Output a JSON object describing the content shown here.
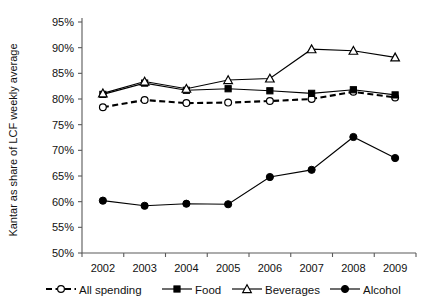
{
  "chart_data": {
    "type": "line",
    "title": "",
    "xlabel": "",
    "ylabel": "Kantar as share of LCF weekly average",
    "categories": [
      "2002",
      "2003",
      "2004",
      "2005",
      "2006",
      "2007",
      "2008",
      "2009"
    ],
    "x": [
      2002,
      2003,
      2004,
      2005,
      2006,
      2007,
      2008,
      2009
    ],
    "ylim": [
      50,
      95
    ],
    "yticks": [
      50,
      55,
      60,
      65,
      70,
      75,
      80,
      85,
      90,
      95
    ],
    "ytick_labels": [
      "50%",
      "55%",
      "60%",
      "65%",
      "70%",
      "75%",
      "80%",
      "85%",
      "90%",
      "95%"
    ],
    "grid": false,
    "legend_position": "bottom",
    "series": [
      {
        "name": "All spending",
        "values": [
          78.4,
          79.8,
          79.2,
          79.3,
          79.6,
          80.0,
          81.4,
          80.3
        ],
        "line_style": "dashed",
        "marker": "open-circle"
      },
      {
        "name": "Food",
        "values": [
          80.9,
          83.1,
          81.7,
          82.0,
          81.6,
          81.1,
          81.8,
          80.8
        ],
        "line_style": "solid",
        "marker": "filled-square"
      },
      {
        "name": "Beverages",
        "values": [
          81.1,
          83.4,
          82.0,
          83.7,
          84.0,
          89.7,
          89.4,
          88.1
        ],
        "line_style": "solid",
        "marker": "open-triangle"
      },
      {
        "name": "Alcohol",
        "values": [
          60.2,
          59.2,
          59.6,
          59.5,
          64.8,
          66.2,
          72.6,
          68.5
        ],
        "line_style": "solid",
        "marker": "filled-circle"
      }
    ]
  },
  "axis": {
    "y_title": "Kantar as share of LCF weekly average"
  },
  "legend": {
    "items": [
      {
        "label": "All spending"
      },
      {
        "label": "Food"
      },
      {
        "label": "Beverages"
      },
      {
        "label": "Alcohol"
      }
    ]
  },
  "colors": {
    "ink": "#000000",
    "axis": "#5a5a5a",
    "background": "#ffffff"
  }
}
